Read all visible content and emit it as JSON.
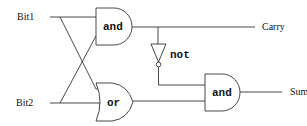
{
  "diagram": {
    "inputs": [
      {
        "id": "bit1",
        "label": "Bit1"
      },
      {
        "id": "bit2",
        "label": "Bit2"
      }
    ],
    "outputs": [
      {
        "id": "carry",
        "label": "Carry"
      },
      {
        "id": "sum",
        "label": "Sum"
      }
    ],
    "gates": [
      {
        "id": "and1",
        "type": "and",
        "label": "and"
      },
      {
        "id": "or1",
        "type": "or",
        "label": "or"
      },
      {
        "id": "not1",
        "type": "not",
        "label": "not"
      },
      {
        "id": "and2",
        "type": "and",
        "label": "and"
      }
    ],
    "connections": [
      [
        "bit1",
        "and1"
      ],
      [
        "bit2",
        "and1"
      ],
      [
        "bit1",
        "or1"
      ],
      [
        "bit2",
        "or1"
      ],
      [
        "and1",
        "carry"
      ],
      [
        "and1",
        "not1"
      ],
      [
        "not1",
        "and2"
      ],
      [
        "or1",
        "and2"
      ],
      [
        "and2",
        "sum"
      ]
    ],
    "colors": {
      "stroke": "#333333",
      "background": "#ffffff"
    }
  }
}
